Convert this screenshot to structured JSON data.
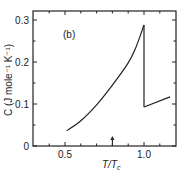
{
  "chart_data": {
    "type": "line",
    "panel_label": "(b)",
    "title": "",
    "xlabel": "T/T_c",
    "xlabel_main": "T/T",
    "xlabel_sub": "c",
    "ylabel": "C (J mole⁻¹ K⁻¹)",
    "xlim": [
      0.3,
      1.2
    ],
    "ylim": [
      0,
      0.32
    ],
    "x_ticks": [
      0.5,
      1.0
    ],
    "x_tick_labels": [
      "0.5",
      "1.0"
    ],
    "y_ticks": [
      0,
      0.1,
      0.2,
      0.3
    ],
    "y_tick_labels": [
      "0",
      "0.1",
      "0.2",
      "0.3"
    ],
    "grid": false,
    "legend": null,
    "annotations": [
      {
        "type": "arrow",
        "x": 0.8,
        "direction": "up",
        "position": "bottom axis"
      }
    ],
    "series": [
      {
        "name": "below Tc",
        "x": [
          0.51,
          0.6,
          0.7,
          0.8,
          0.9,
          0.95,
          1.0
        ],
        "y": [
          0.036,
          0.06,
          0.098,
          0.145,
          0.198,
          0.236,
          0.288
        ]
      },
      {
        "name": "jump at Tc",
        "x": [
          1.0,
          1.0
        ],
        "y": [
          0.288,
          0.093
        ]
      },
      {
        "name": "above Tc",
        "x": [
          1.0,
          1.165
        ],
        "y": [
          0.093,
          0.117
        ]
      }
    ]
  }
}
